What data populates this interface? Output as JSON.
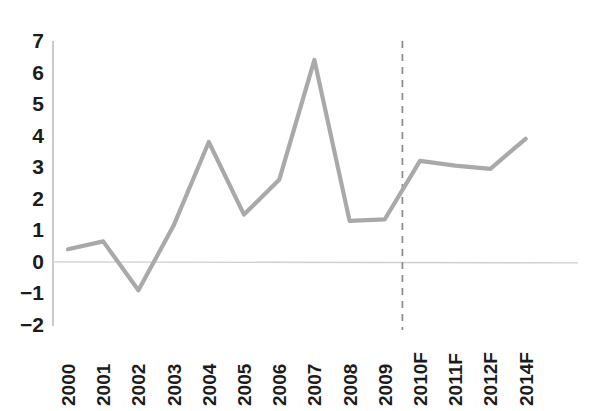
{
  "chart_data": {
    "type": "line",
    "title": "",
    "subtitle": "",
    "xlabel": "",
    "ylabel": "",
    "categories": [
      "2000",
      "2001",
      "2002",
      "2003",
      "2004",
      "2005",
      "2006",
      "2007",
      "2008",
      "2009",
      "2010F",
      "2011F",
      "2012F",
      "2014F"
    ],
    "values": [
      0.4,
      0.65,
      -0.9,
      1.15,
      3.8,
      1.5,
      2.6,
      6.4,
      1.3,
      1.35,
      3.2,
      3.05,
      2.95,
      3.9
    ],
    "series": [
      {
        "name": "",
        "values": [
          0.4,
          0.65,
          -0.9,
          1.15,
          3.8,
          1.5,
          2.6,
          6.4,
          1.3,
          1.35,
          3.2,
          3.05,
          2.95,
          3.9
        ],
        "color": "#a9a9a9"
      }
    ],
    "ylim": [
      -2,
      7
    ],
    "yticks": [
      7,
      6,
      5,
      4,
      3,
      2,
      1,
      0,
      -1,
      -2
    ],
    "ytick_labels": [
      "7",
      "6",
      "5",
      "4",
      "3",
      "2",
      "1",
      "0",
      "−1",
      "−2"
    ],
    "grid": false,
    "legend": null,
    "legend_position": "none",
    "zero_line": 0,
    "annotations": [
      {
        "type": "vertical-dashed-line",
        "label": "forecast-divider",
        "at_category_index": 9.5,
        "between": [
          "2009",
          "2010F"
        ]
      }
    ]
  },
  "axes": {
    "y_axis_color": "#bdbdbd",
    "zero_line_color": "#cfcfcf",
    "divider_color": "#8a8a8a",
    "label_color": "#1c1c1c",
    "background": "#ffffff"
  }
}
